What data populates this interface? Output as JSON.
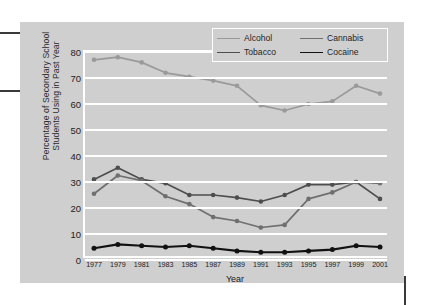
{
  "chart_data": {
    "type": "line",
    "title": "",
    "xlabel": "Year",
    "ylabel": "Percentage of Secondary School\nStudents Using in Past Year",
    "categories": [
      "1977",
      "1979",
      "1981",
      "1983",
      "1985",
      "1987",
      "1989",
      "1991",
      "1993",
      "1995",
      "1997",
      "1999",
      "2001"
    ],
    "x": [
      1977,
      1979,
      1981,
      1983,
      1985,
      1987,
      1989,
      1991,
      1993,
      1995,
      1997,
      1999,
      2001
    ],
    "xlim": [
      1977,
      2001
    ],
    "ylim": [
      0,
      80
    ],
    "yticks": [
      0,
      10,
      20,
      30,
      40,
      50,
      60,
      70,
      80
    ],
    "grid": true,
    "legend_position": "top-right",
    "series": [
      {
        "name": "Alcohol",
        "color": "#9a9a9a",
        "values": [
          77,
          78,
          76,
          72,
          70.5,
          69,
          67,
          59.5,
          57.5,
          60,
          61,
          67,
          64
        ]
      },
      {
        "name": "Tobacco",
        "color": "#4e4e4e",
        "values": [
          31,
          35.5,
          31,
          29.5,
          25,
          25,
          24,
          22.5,
          25,
          29,
          29,
          30,
          23.5
        ]
      },
      {
        "name": "Cannabis",
        "color": "#6f6f6f",
        "values": [
          25.5,
          32.5,
          30.5,
          24.5,
          21.5,
          16.5,
          15,
          12.5,
          13.5,
          23.5,
          26,
          30,
          29.5
        ]
      },
      {
        "name": "Cocaine",
        "color": "#111111",
        "values": [
          4.5,
          6,
          5.5,
          5,
          5.5,
          4.5,
          3.5,
          3,
          3,
          3.5,
          4,
          5.5,
          5
        ]
      }
    ]
  },
  "legend": {
    "entries": [
      {
        "label": "Alcohol"
      },
      {
        "label": "Cannabis"
      },
      {
        "label": "Tobacco"
      },
      {
        "label": "Cocaine"
      }
    ]
  },
  "colors": {
    "panel_background": "#cfcfcf",
    "gridline": "#ffffff",
    "page_background": "#ffffff",
    "alcohol": "#9a9a9a",
    "tobacco": "#4e4e4e",
    "cannabis": "#6f6f6f",
    "cocaine": "#111111"
  }
}
